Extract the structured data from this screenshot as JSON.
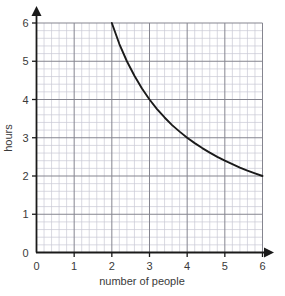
{
  "chart_data": {
    "type": "line",
    "title": "",
    "xlabel": "number of people",
    "ylabel": "hours",
    "xlim": [
      0,
      6
    ],
    "ylim": [
      0,
      6
    ],
    "xticks": [
      "0",
      "1",
      "2",
      "3",
      "4",
      "5",
      "6"
    ],
    "yticks": [
      "0",
      "1",
      "2",
      "3",
      "4",
      "5",
      "6"
    ],
    "xtick_values": [
      0,
      1,
      2,
      3,
      4,
      5,
      6
    ],
    "ytick_values": [
      0,
      1,
      2,
      3,
      4,
      5,
      6
    ],
    "grid": true,
    "grid_minor_subdivisions": 5,
    "legend": "none",
    "relationship": "y = 12 / x",
    "series": [
      {
        "name": "hours vs number of people",
        "color": "#1a1a1a",
        "x": [
          2.0,
          2.2,
          2.4,
          2.6,
          2.8,
          3.0,
          3.2,
          3.4,
          3.6,
          3.8,
          4.0,
          4.2,
          4.4,
          4.6,
          4.8,
          5.0,
          5.2,
          5.4,
          5.6,
          5.8,
          6.0
        ],
        "values": [
          6.0,
          5.45,
          5.0,
          4.62,
          4.29,
          4.0,
          3.75,
          3.53,
          3.33,
          3.16,
          3.0,
          2.86,
          2.73,
          2.61,
          2.5,
          2.4,
          2.31,
          2.22,
          2.14,
          2.07,
          2.0
        ]
      }
    ]
  },
  "axes": {
    "x_axis_name": "x-axis",
    "y_axis_name": "y-axis",
    "origin_label": "0"
  },
  "colors": {
    "minor_grid": "#c9c9d4",
    "major_grid": "#85858f",
    "axis": "#1a1a1a",
    "curve": "#1a1a1a",
    "background": "#ffffff",
    "text": "#3a3a3a"
  }
}
